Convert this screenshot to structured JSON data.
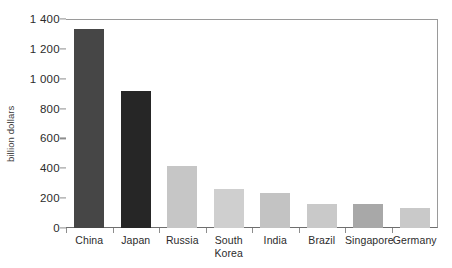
{
  "chart_data": {
    "type": "bar",
    "title": "",
    "subtitle": "",
    "xlabel": "",
    "ylabel": "billion dollars",
    "ylim": [
      0,
      1400
    ],
    "ytick_values": [
      0,
      200,
      400,
      600,
      800,
      1000,
      1200,
      1400
    ],
    "ytick_labels": [
      "0",
      "200",
      "400",
      "600",
      "800",
      "1 000",
      "1 200",
      "1 400"
    ],
    "grid": false,
    "legend": null,
    "categories": [
      "China",
      "Japan",
      "Russia",
      "South Korea",
      "India",
      "Brazil",
      "Singapore",
      "Germany"
    ],
    "category_lines": [
      [
        "China"
      ],
      [
        "Japan"
      ],
      [
        "Russia"
      ],
      [
        "South",
        "Korea"
      ],
      [
        "India"
      ],
      [
        "Brazil"
      ],
      [
        "Singapore"
      ],
      [
        "Germany"
      ]
    ],
    "values": [
      1333,
      918,
      415,
      260,
      234,
      160,
      160,
      134
    ],
    "bar_colors": [
      "#464646",
      "#262626",
      "#c6c6c6",
      "#cfcfcf",
      "#c3c3c3",
      "#c9c9c9",
      "#a8a8a8",
      "#c9c9c9"
    ]
  },
  "axes": {
    "axis_color": "#9a9a9a",
    "tick_color": "#8d8d8d",
    "text_color": "#2b2b2b"
  }
}
